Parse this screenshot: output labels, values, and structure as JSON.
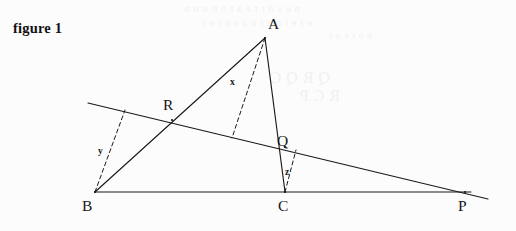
{
  "figure": {
    "caption": "figure 1",
    "background_color": "#fcfcfc",
    "ink_color": "#1a1a1a"
  },
  "chart_data": {
    "type": "diagram",
    "title": "figure 1",
    "xlabel": "",
    "ylabel": "",
    "points": [
      {
        "name": "A",
        "x": 265,
        "y": 38,
        "label": "A",
        "label_x": 268,
        "label_y": 16
      },
      {
        "name": "B",
        "x": 95,
        "y": 192,
        "label": "B",
        "label_x": 82,
        "label_y": 198
      },
      {
        "name": "C",
        "x": 285,
        "y": 192,
        "label": "C",
        "label_x": 278,
        "label_y": 198
      },
      {
        "name": "P",
        "x": 465,
        "y": 192,
        "label": "P",
        "label_x": 458,
        "label_y": 198
      },
      {
        "name": "Q",
        "x": 285,
        "y": 147,
        "label": "Q",
        "label_x": 277,
        "label_y": 133
      },
      {
        "name": "R",
        "x": 172,
        "y": 120,
        "label": "R",
        "label_x": 163,
        "label_y": 97
      }
    ],
    "solid_segments": [
      {
        "name": "baseline-BP",
        "from": "B",
        "to": "P",
        "x1": 95,
        "y1": 192,
        "x2": 471,
        "y2": 192
      },
      {
        "name": "side-BA",
        "from": "B",
        "to": "A",
        "x1": 95,
        "y1": 192,
        "x2": 265,
        "y2": 38
      },
      {
        "name": "side-AC",
        "from": "A",
        "to": "C",
        "x1": 265,
        "y1": 38,
        "x2": 285,
        "y2": 192
      },
      {
        "name": "transversal",
        "from": "left-edge",
        "to": "beyond-P",
        "x1": 88,
        "y1": 103,
        "x2": 488,
        "y2": 199
      }
    ],
    "dashed_segments": [
      {
        "name": "perp-x-from-A",
        "label": "x",
        "x1": 265,
        "y1": 38,
        "x2": 232,
        "y2": 138,
        "label_x": 230,
        "label_y": 78
      },
      {
        "name": "perp-y-from-B",
        "label": "y",
        "x1": 95,
        "y1": 192,
        "x2": 125,
        "y2": 110,
        "label_x": 98,
        "label_y": 147
      },
      {
        "name": "perp-z-from-C",
        "label": "z",
        "x1": 285,
        "y1": 192,
        "x2": 296,
        "y2": 150,
        "label_x": 285,
        "label_y": 168
      }
    ],
    "segment_labels": [
      {
        "name": "label-x",
        "text": "x"
      },
      {
        "name": "label-y",
        "text": "y"
      },
      {
        "name": "label-z",
        "text": "z"
      }
    ],
    "vertex_labels": [
      {
        "name": "label-A",
        "text": "A"
      },
      {
        "name": "label-B",
        "text": "B"
      },
      {
        "name": "label-C",
        "text": "C"
      },
      {
        "name": "label-P",
        "text": "P"
      },
      {
        "name": "label-Q",
        "text": "Q"
      },
      {
        "name": "label-R",
        "text": "R"
      }
    ]
  },
  "bleedthrough": {
    "note": "faint mirrored show-through text from the reverse side of the page",
    "lines": [
      {
        "text": "n e  s  d  r   t  e   a t  o   n  o   u n",
        "x": 300,
        "y": 2,
        "size": 11
      },
      {
        "text": "e  t  e   i n  a  l  n   a  s   n  t  e  r",
        "x": 312,
        "y": 16,
        "size": 11
      },
      {
        "text": "h o   t   e  o   t",
        "x": 372,
        "y": 30,
        "size": 10
      },
      {
        "text": "Q  R  Q C",
        "x": 330,
        "y": 68,
        "size": 16
      },
      {
        "text": "R  C  P",
        "x": 340,
        "y": 86,
        "size": 16
      }
    ]
  }
}
